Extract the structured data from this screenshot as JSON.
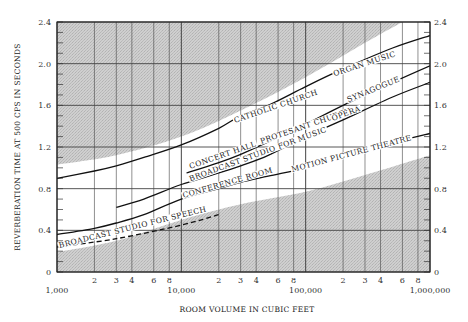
{
  "chart_data": {
    "type": "line",
    "title": "",
    "xlabel": "ROOM VOLUME IN CUBIC FEET",
    "ylabel": "REVERBERATION TIME AT 500 CPS IN SECONDS",
    "xscale": "log",
    "xlim": [
      1000,
      1000000
    ],
    "ylim": [
      0,
      2.4
    ],
    "grid": true,
    "x_major_ticks": [
      {
        "value": 1000,
        "label": "1,000"
      },
      {
        "value": 10000,
        "label": "10,000"
      },
      {
        "value": 100000,
        "label": "100,000"
      },
      {
        "value": 1000000,
        "label": "1,000,000"
      }
    ],
    "x_minor_ticks": [
      {
        "value": 2000,
        "label": "2"
      },
      {
        "value": 3000,
        "label": "3"
      },
      {
        "value": 4000,
        "label": "4"
      },
      {
        "value": 6000,
        "label": "6"
      },
      {
        "value": 8000,
        "label": "8"
      },
      {
        "value": 20000,
        "label": "2"
      },
      {
        "value": 30000,
        "label": "3"
      },
      {
        "value": 40000,
        "label": "4"
      },
      {
        "value": 60000,
        "label": "6"
      },
      {
        "value": 80000,
        "label": "8"
      },
      {
        "value": 200000,
        "label": "2"
      },
      {
        "value": 300000,
        "label": "3"
      },
      {
        "value": 400000,
        "label": "4"
      },
      {
        "value": 600000,
        "label": "6"
      },
      {
        "value": 800000,
        "label": "8"
      }
    ],
    "y_ticks": [
      {
        "value": 0,
        "label": "0"
      },
      {
        "value": 0.4,
        "label": "0.4"
      },
      {
        "value": 0.8,
        "label": "0.8"
      },
      {
        "value": 1.2,
        "label": "1.2"
      },
      {
        "value": 1.6,
        "label": "1.6"
      },
      {
        "value": 2.0,
        "label": "2.0"
      },
      {
        "value": 2.4,
        "label": "2.4"
      }
    ],
    "shaded_band": {
      "description": "Shaded regions above and below the recommended range",
      "upper_boundary": {
        "x": [
          1000,
          3000,
          10000,
          30000,
          100000,
          300000,
          600000
        ],
        "y": [
          1.03,
          1.12,
          1.3,
          1.55,
          1.87,
          2.2,
          2.4
        ]
      },
      "lower_boundary": {
        "x": [
          1000,
          3000,
          10000,
          30000,
          100000,
          300000,
          1000000
        ],
        "y": [
          0.19,
          0.3,
          0.5,
          0.65,
          0.77,
          0.93,
          1.12
        ]
      }
    },
    "series": [
      {
        "name": "Catholic church — Organ music",
        "style": "solid",
        "x": [
          1000,
          2000,
          3000,
          5000,
          10000,
          20000,
          30000,
          50000,
          100000,
          200000,
          500000,
          1000000
        ],
        "y": [
          0.9,
          0.97,
          1.02,
          1.1,
          1.22,
          1.38,
          1.5,
          1.6,
          1.78,
          1.95,
          2.15,
          2.27
        ]
      },
      {
        "name": "Concert hall — Protesant church — Synagogue",
        "style": "solid",
        "x": [
          11000,
          20000,
          30000,
          50000,
          100000,
          200000,
          500000,
          1000000
        ],
        "y": [
          0.95,
          1.05,
          1.13,
          1.25,
          1.42,
          1.6,
          1.82,
          1.98
        ]
      },
      {
        "name": "Broadcast studio for music — Opera",
        "style": "solid",
        "x": [
          3000,
          5000,
          10000,
          20000,
          30000,
          50000,
          100000,
          200000,
          500000,
          1000000
        ],
        "y": [
          0.62,
          0.7,
          0.84,
          0.95,
          1.02,
          1.12,
          1.3,
          1.46,
          1.68,
          1.82
        ]
      },
      {
        "name": "Broadcast studio for speech — Conference room — Motion picture theatre",
        "style": "solid",
        "x": [
          1000,
          2000,
          3000,
          5000,
          10000,
          20000,
          30000,
          50000,
          100000,
          200000,
          500000,
          1000000
        ],
        "y": [
          0.36,
          0.42,
          0.47,
          0.55,
          0.7,
          0.8,
          0.86,
          0.92,
          1.0,
          1.1,
          1.24,
          1.33
        ]
      },
      {
        "name": "Broadcast studio for speech",
        "style": "dashed",
        "x": [
          1000,
          3000,
          10000,
          20000
        ],
        "y": [
          0.24,
          0.32,
          0.45,
          0.55
        ]
      }
    ],
    "annotations": [
      "CATHOLIC CHURCH",
      "ORGAN MUSIC",
      "CONCERT HALL",
      "PROTESANT CHURCH",
      "SYNAGOGUE",
      "BROADCAST STUDIO FOR MUSIC",
      "OPERA",
      "CONFERENCE ROOM",
      "MOTION PICTURE THEATRE",
      "BROADCAST STUDIO FOR SPEECH"
    ]
  },
  "labels": {
    "catholic": "CATHOLIC CHURCH",
    "organ": "ORGAN MUSIC",
    "concert": "CONCERT HALL",
    "protestant": "PROTESANT CHURCH",
    "synagogue": "SYNAGOGUE",
    "bcast_music": "BROADCAST STUDIO FOR MUSIC",
    "opera": "OPERA",
    "conference": "CONFERENCE ROOM",
    "motion": "MOTION PICTURE THEATRE",
    "speech": "BROADCAST STUDIO FOR SPEECH"
  },
  "colors": {
    "shade": "#c9c9c9",
    "grid": "#444444",
    "curve": "#111111",
    "background": "#ffffff"
  }
}
